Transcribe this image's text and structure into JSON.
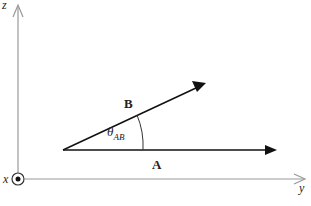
{
  "diagram": {
    "axes": {
      "z_label": "z",
      "y_label": "y",
      "x_label": "x",
      "x_symbol": "out-of-page dot (⊙)"
    },
    "vectors": [
      {
        "name": "B",
        "label": "B",
        "from": [
          63,
          150
        ],
        "to": [
          205,
          84
        ]
      },
      {
        "name": "A",
        "label": "A",
        "from": [
          63,
          150
        ],
        "to": [
          276,
          150
        ]
      }
    ],
    "angle": {
      "symbol": "θ",
      "subscript": "AB"
    },
    "colors": {
      "axis": "#999999",
      "vector": "#111111",
      "text": "#222222"
    }
  }
}
